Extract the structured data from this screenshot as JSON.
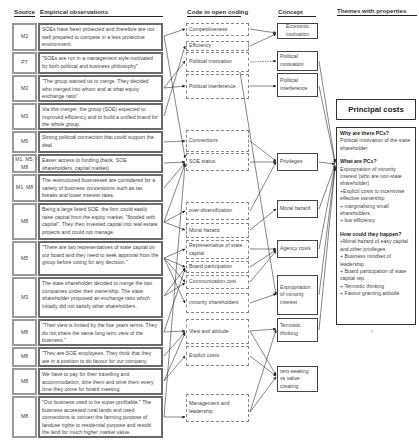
{
  "headers": {
    "source": "Source",
    "observations": "Empirical observations",
    "code": "Code in open coding",
    "concept": "Concept",
    "themes": "Themes with properties"
  },
  "rows": [
    {
      "source": "M2",
      "text": "SOEs have been protected and therefore are not well prepared to compete in a less protective environment."
    },
    {
      "source": "P7",
      "text": "\"SOEs are run in a management style motivated by both political and business philosophy\""
    },
    {
      "source": "M3",
      "text": "\"The group wanted us to merge. They decided who merged into whom and at what equity exchange ratio\"."
    },
    {
      "source": "M3",
      "text": "Via this merger, the group (SOE) expected to improved efficiency and to build a unified brand for the whole group."
    },
    {
      "source": "M5",
      "text": "Strong political connection that could support the deal"
    },
    {
      "source": "M1, M5, M8",
      "text": "Easier access to funding (bank, SOE shareholders, capital market)"
    },
    {
      "source": "M1, M8",
      "text": "The restructured businesses are considered for a variety of business concessions such as tax breaks and lower interest rates."
    },
    {
      "source": "M8",
      "text": "Being a large listed SOE, the firm could easily raise capital from the equity market, \"flooded with capital\". They then invested capital into real estate projects and could not manage."
    },
    {
      "source": "M5",
      "text": "\"There are two representatives of state capital on our board and they need to seek approval from the group before voting for any decision.\""
    },
    {
      "source": "M3",
      "text": "The state shareholder decided to merge the two companies under their ownership. The state shareholder proposed an exchange ratio which initially did not satisfy other shareholders."
    },
    {
      "source": "M8",
      "text": "\"Their view is limited by the five years terms. They do not share the same long term view of the business.\""
    },
    {
      "source": "M8",
      "text": "\"They are SOE employees. They think that they are in a position to do favour for our company."
    },
    {
      "source": "M8",
      "text": "We have to pay for their travelling and accommodation, dine them and wine them every time they come for board meeting."
    },
    {
      "source": "M8",
      "text": "\"Our business used to be super-profitable.\" The business accessed rural lands and used connections to convert the farming purpose of landuse rights to residential purpose and resold the land for much higher market value."
    }
  ],
  "codes": [
    "Competitiveness",
    "Efficiency",
    "Political motivation",
    "Political interference",
    "Connections",
    "SOE status",
    "over-diversification",
    "Moral hazard",
    "Representative of state capital",
    "Board participation",
    "Communication cost",
    "minority shareholders",
    "View and attitude",
    "Explicit costs",
    "Management and leadership"
  ],
  "concepts": [
    "Economic motivation",
    "Political motivation",
    "Political interference",
    "Privileges",
    "Moral hazard",
    "Agency costs",
    "Expropriation of minority interest",
    "Termistic thinking",
    "rent-seeking vs value-creating"
  ],
  "theme": {
    "title": "Principal costs",
    "q1": "Why are there PCs?",
    "a1": "Political motivation of the state shareholder",
    "q2": "What are PCs?",
    "a2": [
      "Expropriation of minority interest (who are non-state shareholder)",
      "+Explicit costs to incentivise effective ownership",
      "+ marginalising small shareholders",
      "+ low efficiency"
    ],
    "q3": "How could they happen?",
    "a3": [
      "+Moral hazard of easy capital and other privileges",
      "+ Business mindset of leadership",
      "+ Board participation of state capital rep.",
      "+ Termistic thinking",
      "+ Favour granting attitude"
    ]
  },
  "page_mark": "ii"
}
